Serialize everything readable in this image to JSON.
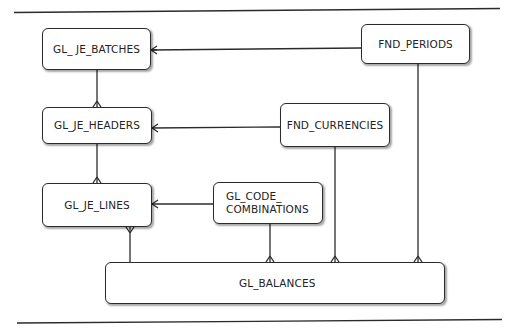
{
  "diagram": {
    "type": "entity-relationship",
    "entities": [
      {
        "id": "gl_je_batches",
        "label": "GL_ JE_BATCHES"
      },
      {
        "id": "fnd_periods",
        "label": "FND_PERIODS"
      },
      {
        "id": "gl_je_headers",
        "label": "GL_JE_HEADERS"
      },
      {
        "id": "fnd_currencies",
        "label": "FND_CURRENCIES"
      },
      {
        "id": "gl_je_lines",
        "label": "GL_JE_LINES"
      },
      {
        "id": "gl_code_combinations",
        "label_line1": "GL_CODE_",
        "label_line2": "COMBINATIONS"
      },
      {
        "id": "gl_balances",
        "label": "GL_BALANCES"
      }
    ],
    "relationships": [
      {
        "from": "fnd_periods",
        "to": "gl_je_batches",
        "many_end": "gl_je_batches"
      },
      {
        "from": "gl_je_batches",
        "to": "gl_je_headers",
        "many_end": "gl_je_headers"
      },
      {
        "from": "fnd_currencies",
        "to": "gl_je_headers",
        "many_end": "gl_je_headers"
      },
      {
        "from": "gl_je_headers",
        "to": "gl_je_lines",
        "many_end": "gl_je_lines"
      },
      {
        "from": "gl_code_combinations",
        "to": "gl_je_lines",
        "many_end": "gl_je_lines"
      },
      {
        "from": "gl_balances",
        "to": "gl_je_lines",
        "many_end": "gl_je_lines"
      },
      {
        "from": "gl_code_combinations",
        "to": "gl_balances",
        "many_end": "gl_balances"
      },
      {
        "from": "fnd_currencies",
        "to": "gl_balances",
        "many_end": "gl_balances"
      },
      {
        "from": "fnd_periods",
        "to": "gl_balances",
        "many_end": "gl_balances"
      }
    ]
  }
}
